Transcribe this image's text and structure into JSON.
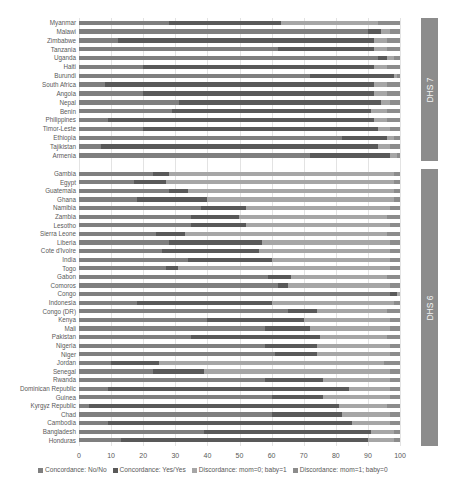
{
  "chart_data": {
    "type": "bar",
    "orientation": "horizontal",
    "stacked": true,
    "title": "",
    "xlabel": "",
    "ylabel": "",
    "xlim": [
      0,
      100
    ],
    "x_ticks": [
      "0",
      "10",
      "20",
      "30",
      "40",
      "50",
      "60",
      "70",
      "80",
      "90",
      "100"
    ],
    "grid": true,
    "legend_position": "bottom",
    "series_names": [
      "Concordance: No/No",
      "Concordance: Yes/Yes",
      "Discordance: mom=0; baby=1",
      "Discordance: mom=1; baby=0"
    ],
    "series_colors": [
      "#7f7f7f",
      "#595959",
      "#a6a6a6",
      "#8c8c8c"
    ],
    "groups": [
      {
        "label": "DHS 7",
        "categories": [
          "Myanmar",
          "Malawi",
          "Zimbabwe",
          "Tanzania",
          "Uganda",
          "Haiti",
          "Burundi",
          "South Africa",
          "Angola",
          "Nepal",
          "Benin",
          "Philippines",
          "Timor-Leste",
          "Ethiopia",
          "Tajikistan",
          "Armenia"
        ],
        "series": [
          {
            "name": "Concordance: No/No",
            "values": [
              28,
              90,
              12,
              62,
              93,
              20,
              72,
              8,
              20,
              31,
              29,
              9,
              20,
              82,
              7,
              72
            ]
          },
          {
            "name": "Concordance: Yes/Yes",
            "values": [
              35,
              4,
              80,
              30,
              3,
              72,
              26,
              84,
              72,
              63,
              62,
              83,
              73,
              14,
              86,
              25
            ]
          },
          {
            "name": "Discordance: mom=0; baby=1",
            "values": [
              30,
              3,
              4,
              4,
              2,
              4,
              1,
              4,
              4,
              3,
              5,
              4,
              4,
              2,
              4,
              2
            ]
          },
          {
            "name": "Discordance: mom=1; baby=0",
            "values": [
              7,
              3,
              4,
              4,
              2,
              4,
              1,
              4,
              4,
              3,
              4,
              4,
              3,
              2,
              3,
              1
            ]
          }
        ]
      },
      {
        "label": "DHS 6",
        "categories": [
          "Gambia",
          "Egypt",
          "Guatemala",
          "Ghana",
          "Namibia",
          "Zambia",
          "Lesotho",
          "Sierra Leone",
          "Liberia",
          "Cote d'Ivoire",
          "India",
          "Togo",
          "Gabon",
          "Comoros",
          "Congo",
          "Indonesia",
          "Congo (DR)",
          "Kenya",
          "Mali",
          "Pakistan",
          "Nigeria",
          "Niger",
          "Jordan",
          "Senegal",
          "Rwanda",
          "Dominican Republic",
          "Guinea",
          "Kyrgyz Republic",
          "Chad",
          "Cambodia",
          "Bangladesh",
          "Honduras"
        ],
        "series": [
          {
            "name": "Concordance: No/No",
            "values": [
              23,
              17,
              28,
              18,
              38,
              35,
              35,
              24,
              28,
              26,
              34,
              27,
              59,
              62,
              97,
              18,
              65,
              40,
              58,
              35,
              58,
              61,
              10,
              23,
              58,
              9,
              60,
              3,
              60,
              9,
              39,
              13
            ]
          },
          {
            "name": "Concordance: Yes/Yes",
            "values": [
              5,
              10,
              6,
              22,
              14,
              15,
              17,
              9,
              29,
              30,
              26,
              4,
              7,
              3,
              2,
              42,
              9,
              30,
              14,
              40,
              16,
              13,
              15,
              16,
              18,
              75,
              16,
              78,
              22,
              76,
              52,
              77
            ]
          },
          {
            "name": "Discordance: mom=0; baby=1",
            "values": [
              70,
              71,
              64,
              58,
              45,
              46,
              45,
              63,
              40,
              41,
              37,
              66,
              30,
              32,
              1,
              38,
              22,
              27,
              25,
              21,
              23,
              23,
              70,
              58,
              21,
              13,
              21,
              15,
              15,
              12,
              7,
              8
            ]
          },
          {
            "name": "Discordance: mom=1; baby=0",
            "values": [
              2,
              2,
              2,
              2,
              3,
              4,
              3,
              4,
              3,
              3,
              3,
              3,
              4,
              3,
              0,
              2,
              4,
              3,
              3,
              4,
              3,
              3,
              5,
              3,
              3,
              3,
              3,
              4,
              3,
              3,
              2,
              2
            ]
          }
        ]
      }
    ]
  },
  "legend": [
    {
      "label": "Concordance: No/No",
      "color": "#7f7f7f"
    },
    {
      "label": "Concordance: Yes/Yes",
      "color": "#595959"
    },
    {
      "label": "Discordance: mom=0; baby=1",
      "color": "#a6a6a6"
    },
    {
      "label": "Discordance: mom=1; baby=0",
      "color": "#8c8c8c"
    }
  ],
  "panels": [
    {
      "label": "DHS 7"
    },
    {
      "label": "DHS 6"
    }
  ]
}
